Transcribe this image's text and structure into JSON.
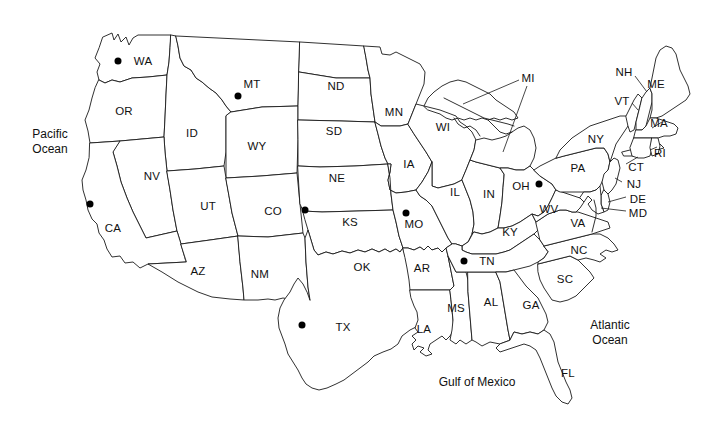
{
  "map": {
    "title": "United States map with state abbreviations",
    "background_color": "#ffffff",
    "outline_color": "#1a1a1a",
    "marker_color": "#000000",
    "ocean_labels": [
      {
        "name": "pacific-ocean",
        "line1": "Pacific",
        "line2": "Ocean",
        "x": 50,
        "y": 142
      },
      {
        "name": "atlantic-ocean",
        "line1": "Atlantic",
        "line2": "Ocean",
        "x": 610,
        "y": 333
      },
      {
        "name": "gulf-of-mexico",
        "line1": "Gulf of Mexico",
        "line2": "",
        "x": 477,
        "y": 382
      }
    ],
    "state_labels": [
      {
        "code": "WA",
        "x": 143,
        "y": 61
      },
      {
        "code": "OR",
        "x": 124,
        "y": 111
      },
      {
        "code": "ID",
        "x": 192,
        "y": 133
      },
      {
        "code": "MT",
        "x": 252,
        "y": 84
      },
      {
        "code": "WY",
        "x": 257,
        "y": 146
      },
      {
        "code": "NV",
        "x": 152,
        "y": 176
      },
      {
        "code": "UT",
        "x": 208,
        "y": 206
      },
      {
        "code": "CA",
        "x": 113,
        "y": 228
      },
      {
        "code": "AZ",
        "x": 198,
        "y": 271
      },
      {
        "code": "NM",
        "x": 260,
        "y": 274
      },
      {
        "code": "CO",
        "x": 273,
        "y": 211
      },
      {
        "code": "ND",
        "x": 336,
        "y": 86
      },
      {
        "code": "SD",
        "x": 334,
        "y": 131
      },
      {
        "code": "NE",
        "x": 337,
        "y": 178
      },
      {
        "code": "KS",
        "x": 350,
        "y": 222
      },
      {
        "code": "OK",
        "x": 362,
        "y": 267
      },
      {
        "code": "TX",
        "x": 343,
        "y": 327
      },
      {
        "code": "MN",
        "x": 394,
        "y": 112
      },
      {
        "code": "IA",
        "x": 409,
        "y": 164
      },
      {
        "code": "MO",
        "x": 414,
        "y": 224
      },
      {
        "code": "AR",
        "x": 422,
        "y": 268
      },
      {
        "code": "LA",
        "x": 424,
        "y": 329
      },
      {
        "code": "WI",
        "x": 443,
        "y": 127
      },
      {
        "code": "IL",
        "x": 455,
        "y": 192
      },
      {
        "code": "IN",
        "x": 489,
        "y": 194
      },
      {
        "code": "MS",
        "x": 456,
        "y": 308
      },
      {
        "code": "AL",
        "x": 491,
        "y": 302
      },
      {
        "code": "MI",
        "x": 528,
        "y": 78
      },
      {
        "code": "OH",
        "x": 521,
        "y": 186
      },
      {
        "code": "KY",
        "x": 510,
        "y": 232
      },
      {
        "code": "TN",
        "x": 487,
        "y": 261
      },
      {
        "code": "GA",
        "x": 531,
        "y": 305
      },
      {
        "code": "FL",
        "x": 568,
        "y": 373
      },
      {
        "code": "SC",
        "x": 565,
        "y": 279
      },
      {
        "code": "NC",
        "x": 579,
        "y": 250
      },
      {
        "code": "VA",
        "x": 578,
        "y": 223
      },
      {
        "code": "WV",
        "x": 549,
        "y": 209
      },
      {
        "code": "PA",
        "x": 578,
        "y": 168
      },
      {
        "code": "NY",
        "x": 596,
        "y": 139
      },
      {
        "code": "VT",
        "x": 622,
        "y": 101
      },
      {
        "code": "NH",
        "x": 624,
        "y": 72
      },
      {
        "code": "ME",
        "x": 656,
        "y": 84
      },
      {
        "code": "MA",
        "x": 659,
        "y": 123
      },
      {
        "code": "RI",
        "x": 660,
        "y": 153
      },
      {
        "code": "CT",
        "x": 636,
        "y": 167
      },
      {
        "code": "NJ",
        "x": 634,
        "y": 184
      },
      {
        "code": "DE",
        "x": 638,
        "y": 199
      },
      {
        "code": "MD",
        "x": 638,
        "y": 213
      }
    ],
    "markers": [
      {
        "state": "WA",
        "x": 118,
        "y": 61
      },
      {
        "state": "MT",
        "x": 238,
        "y": 96
      },
      {
        "state": "CA",
        "x": 90,
        "y": 204
      },
      {
        "state": "CO",
        "x": 305,
        "y": 210
      },
      {
        "state": "TX",
        "x": 302,
        "y": 325
      },
      {
        "state": "MO",
        "x": 406,
        "y": 213
      },
      {
        "state": "TN",
        "x": 464,
        "y": 261
      },
      {
        "state": "OH",
        "x": 539,
        "y": 184
      }
    ],
    "marker_count": 8
  }
}
